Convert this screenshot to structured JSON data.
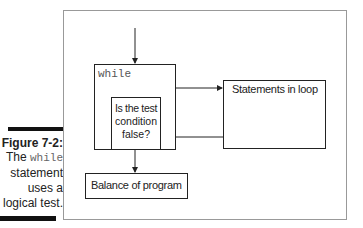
{
  "caption": {
    "figure_label": "Figure 7-2:",
    "line1_prefix": "The ",
    "line1_code": "while",
    "line2": "statement",
    "line3": "uses a",
    "line4": "logical test."
  },
  "diagram": {
    "while_label": "while",
    "condition_text_1": "Is the test",
    "condition_text_2": "condition",
    "condition_text_3": "false?",
    "statements_label": "Statements in loop",
    "balance_label": "Balance of program"
  }
}
